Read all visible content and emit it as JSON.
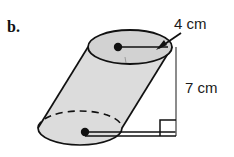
{
  "figure": {
    "part_label": "b.",
    "shape_name": "oblique-cylinder",
    "labels": {
      "diameter": "4 cm",
      "height": "7 cm"
    },
    "colors": {
      "body_fill": "#dcdcdc",
      "top_face_fill": "#d2d2d2",
      "bottom_face_fill": "#dcdcdc",
      "outline": "#111111",
      "background": "#ffffff",
      "text": "#1a1a1a",
      "dimension_line": "#555555"
    },
    "geometry": {
      "top_ellipse": {
        "cx": 130,
        "cy": 47,
        "rx": 42,
        "ry": 17
      },
      "bottom_ellipse": {
        "cx": 80,
        "cy": 128,
        "rx": 42,
        "ry": 17
      },
      "top_center_dot": {
        "cx": 118,
        "cy": 47,
        "r": 4
      },
      "bottom_center_dot": {
        "cx": 85,
        "cy": 132,
        "r": 4
      },
      "height_line": {
        "x": 176,
        "y_top": 47,
        "y_bottom": 136
      },
      "baseline": {
        "y": 136,
        "x_start": 85,
        "x_end": 176
      },
      "right_angle_marker": {
        "x": 160,
        "y": 120,
        "size": 16
      }
    },
    "annotations": {
      "radius_leader_top": "radius-segment-top",
      "radius_leader_bottom": "radius-segment-bottom",
      "arrow": "diameter-arrow"
    }
  }
}
